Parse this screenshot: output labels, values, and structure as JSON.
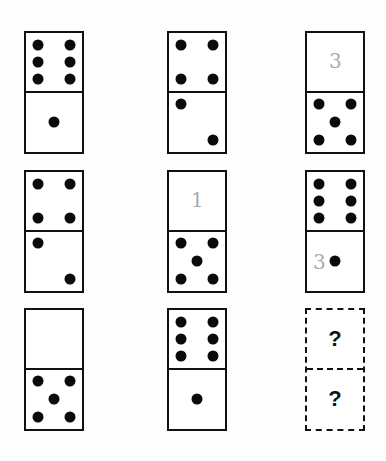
{
  "puzzle": {
    "grid": [
      [
        {
          "top": 6,
          "bottom": 1
        },
        {
          "top": 4,
          "bottom": 2
        },
        {
          "top": 0,
          "bottom": 5,
          "top_note": "3"
        }
      ],
      [
        {
          "top": 4,
          "bottom": 2
        },
        {
          "top": 0,
          "bottom": 5,
          "top_note": "1"
        },
        {
          "top": 6,
          "bottom": 1,
          "bottom_note": "3"
        }
      ],
      [
        {
          "top": 0,
          "bottom": 5
        },
        {
          "top": 6,
          "bottom": 1
        },
        {
          "top": "?",
          "bottom": "?",
          "unknown": true
        }
      ]
    ],
    "unknown_label": "?"
  }
}
